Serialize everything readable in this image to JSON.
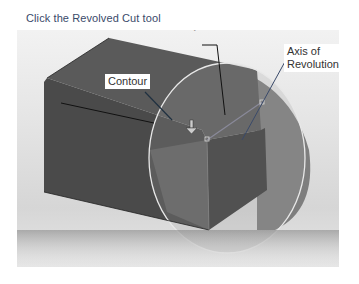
{
  "instruction": "Click the Revolved Cut tool",
  "viewport": {
    "annotations": {
      "dimension": "R40",
      "contour_label": "Contour",
      "axis_label_line1": "Axis of",
      "axis_label_line2": "Revolution"
    }
  },
  "colors": {
    "caption": "#3a4a6a",
    "solid_top": "#5a5a5a",
    "solid_front": "#4a4a4a",
    "solid_side": "#3c3c3c",
    "revolve_preview": "#9a9a9a"
  }
}
